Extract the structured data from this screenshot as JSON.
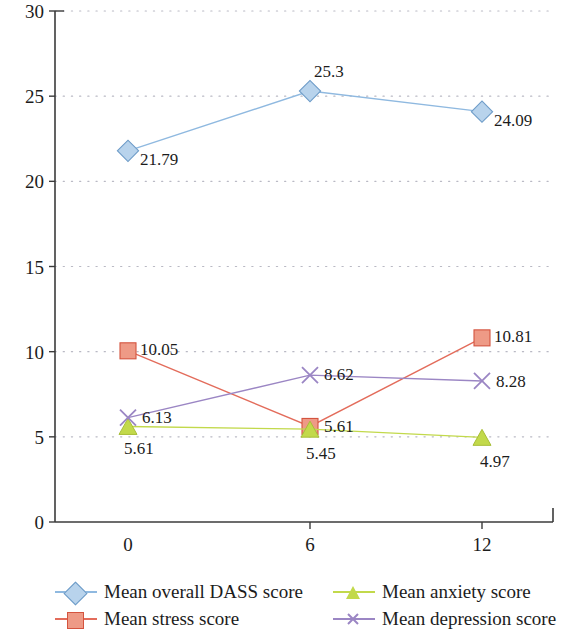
{
  "chart_data": {
    "type": "line",
    "title": "",
    "xlabel": "",
    "ylabel": "",
    "x": [
      0,
      6,
      12
    ],
    "categories": [
      "0",
      "6",
      "12"
    ],
    "xtick_labels": [
      "0",
      "6",
      "12"
    ],
    "ytick_labels": [
      "0",
      "5",
      "10",
      "15",
      "20",
      "25",
      "30"
    ],
    "yticks": [
      0,
      5,
      10,
      15,
      20,
      25,
      30
    ],
    "ylim": [
      0,
      30
    ],
    "grid": "horizontal-dotted",
    "legend_position": "bottom",
    "legend_columns": 2,
    "series": [
      {
        "name": "Mean overall DASS score",
        "values": [
          21.79,
          25.3,
          24.09
        ],
        "labels": [
          "21.79",
          "25.3",
          "24.09"
        ],
        "color": "#8FB9E0",
        "marker": "diamond"
      },
      {
        "name": "Mean stress score",
        "values": [
          10.05,
          5.61,
          10.81
        ],
        "labels": [
          "10.05",
          "5.61",
          "10.81"
        ],
        "color": "#E36C5B",
        "marker": "square"
      },
      {
        "name": "Mean anxiety score",
        "values": [
          5.61,
          5.45,
          4.97
        ],
        "labels": [
          "5.61",
          "5.45",
          "4.97"
        ],
        "color": "#C2D94B",
        "marker": "triangle"
      },
      {
        "name": "Mean depression score",
        "values": [
          6.13,
          8.62,
          8.28
        ],
        "labels": [
          "6.13",
          "8.62",
          "8.28"
        ],
        "color": "#9B86C4",
        "marker": "x"
      }
    ]
  },
  "legend": {
    "items": [
      {
        "label": "Mean overall DASS score",
        "color": "#8FB9E0",
        "marker": "diamond"
      },
      {
        "label": "Mean anxiety score",
        "color": "#C2D94B",
        "marker": "triangle"
      },
      {
        "label": "Mean stress score",
        "color": "#E36C5B",
        "marker": "square"
      },
      {
        "label": "Mean depression score",
        "color": "#9B86C4",
        "marker": "x"
      }
    ]
  },
  "axes": {
    "axis_color": "#3b3b3b",
    "grid_color": "#b9b9c4"
  }
}
